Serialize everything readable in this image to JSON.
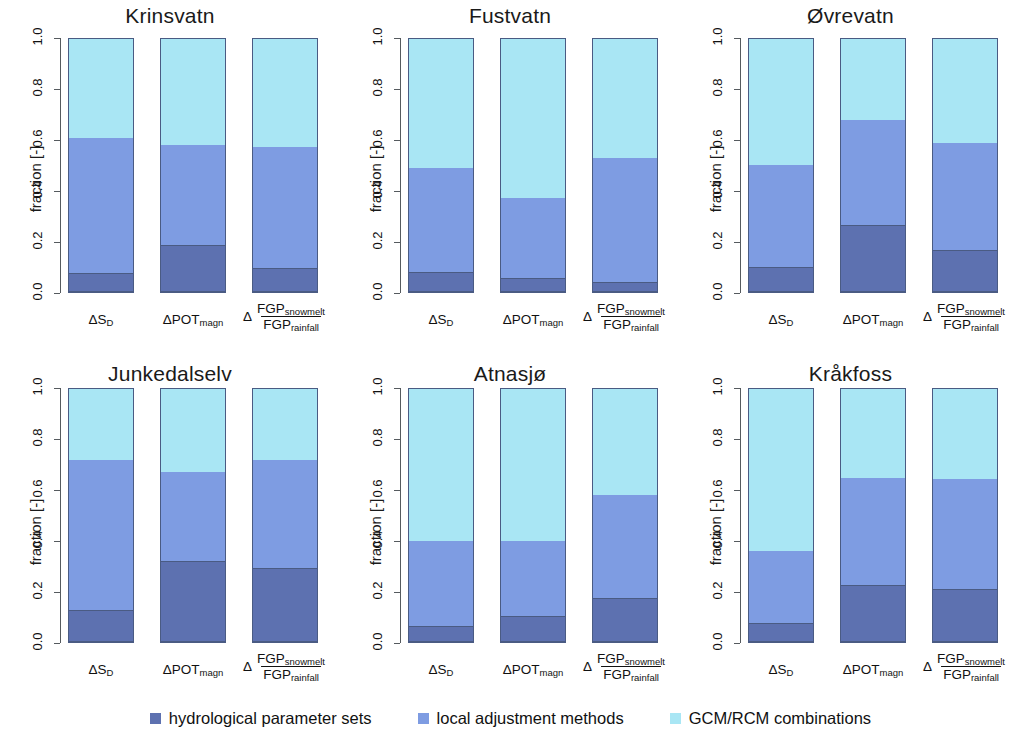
{
  "figure": {
    "ylabel": "fraction [-]",
    "y_ticks": [
      "0.0",
      "0.2",
      "0.4",
      "0.6",
      "0.8",
      "1.0"
    ],
    "x_categories": [
      "dS_D",
      "dPOT_magn",
      "d FGP_snowmelt / FGP_rainfall"
    ],
    "x_labels": [
      {
        "delta": "Δ",
        "base": "S",
        "sub": "D"
      },
      {
        "delta": "Δ",
        "base": "POT",
        "sub": "magn"
      },
      {
        "delta": "Δ",
        "num_base": "FGP",
        "num_sub": "snowmelt",
        "den_base": "FGP",
        "den_sub": "rainfall"
      }
    ]
  },
  "colors": {
    "hydrological_parameter_sets": "#5d71b0",
    "local_adjustment_methods": "#7e9ce2",
    "gcm_rcm_combinations": "#a9e6f4",
    "bar_border": "#4a5b83",
    "axis": "#555a5e"
  },
  "legend": {
    "items": [
      {
        "label": "hydrological parameter sets",
        "color_key": "hydrological_parameter_sets"
      },
      {
        "label": "local adjustment methods",
        "color_key": "local_adjustment_methods"
      },
      {
        "label": "GCM/RCM combinations",
        "color_key": "gcm_rcm_combinations"
      }
    ]
  },
  "chart_data": {
    "type": "bar",
    "title": "",
    "xlabel": "",
    "ylabel": "fraction [-]",
    "ylim": [
      0,
      1
    ],
    "grid": false,
    "legend_position": "bottom",
    "stacked": true,
    "categories": [
      "ΔS_D",
      "ΔPOT_magn",
      "Δ FGP_snowmelt/FGP_rainfall"
    ],
    "series_names": [
      "hydrological parameter sets",
      "local adjustment methods",
      "GCM/RCM combinations"
    ],
    "panels": [
      {
        "title": "Krinsvatn",
        "series": [
          {
            "name": "hydrological parameter sets",
            "values": [
              0.07,
              0.18,
              0.09
            ]
          },
          {
            "name": "local adjustment methods",
            "values": [
              0.535,
              0.395,
              0.48
            ]
          },
          {
            "name": "GCM/RCM combinations",
            "values": [
              0.395,
              0.425,
              0.43
            ]
          }
        ],
        "cumulative_tops": [
          [
            0.07,
            0.605,
            1.0
          ],
          [
            0.18,
            0.575,
            1.0
          ],
          [
            0.09,
            0.57,
            1.0
          ]
        ]
      },
      {
        "title": "Fustvatn",
        "series": [
          {
            "name": "hydrological parameter sets",
            "values": [
              0.075,
              0.05,
              0.035
            ]
          },
          {
            "name": "local adjustment methods",
            "values": [
              0.41,
              0.32,
              0.49
            ]
          },
          {
            "name": "GCM/RCM combinations",
            "values": [
              0.515,
              0.63,
              0.475
            ]
          }
        ],
        "cumulative_tops": [
          [
            0.075,
            0.485,
            1.0
          ],
          [
            0.05,
            0.37,
            1.0
          ],
          [
            0.035,
            0.525,
            1.0
          ]
        ]
      },
      {
        "title": "Øvrevatn",
        "series": [
          {
            "name": "hydrological parameter sets",
            "values": [
              0.095,
              0.26,
              0.16
            ]
          },
          {
            "name": "local adjustment methods",
            "values": [
              0.405,
              0.415,
              0.425
            ]
          },
          {
            "name": "GCM/RCM combinations",
            "values": [
              0.5,
              0.325,
              0.415
            ]
          }
        ],
        "cumulative_tops": [
          [
            0.095,
            0.5,
            1.0
          ],
          [
            0.26,
            0.675,
            1.0
          ],
          [
            0.16,
            0.585,
            1.0
          ]
        ]
      },
      {
        "title": "Junkedalselv",
        "series": [
          {
            "name": "hydrological parameter sets",
            "values": [
              0.12,
              0.315,
              0.285
            ]
          },
          {
            "name": "local adjustment methods",
            "values": [
              0.595,
              0.35,
              0.43
            ]
          },
          {
            "name": "GCM/RCM combinations",
            "values": [
              0.285,
              0.335,
              0.285
            ]
          }
        ],
        "cumulative_tops": [
          [
            0.12,
            0.715,
            1.0
          ],
          [
            0.315,
            0.665,
            1.0
          ],
          [
            0.285,
            0.715,
            1.0
          ]
        ]
      },
      {
        "title": "Atnasjø",
        "series": [
          {
            "name": "hydrological parameter sets",
            "values": [
              0.06,
              0.1,
              0.17
            ]
          },
          {
            "name": "local adjustment methods",
            "values": [
              0.335,
              0.295,
              0.405
            ]
          },
          {
            "name": "GCM/RCM combinations",
            "values": [
              0.605,
              0.605,
              0.425
            ]
          }
        ],
        "cumulative_tops": [
          [
            0.06,
            0.395,
            1.0
          ],
          [
            0.1,
            0.395,
            1.0
          ],
          [
            0.17,
            0.575,
            1.0
          ]
        ]
      },
      {
        "title": "Kråkfoss",
        "series": [
          {
            "name": "hydrological parameter sets",
            "values": [
              0.07,
              0.22,
              0.205
            ]
          },
          {
            "name": "local adjustment methods",
            "values": [
              0.285,
              0.425,
              0.435
            ]
          },
          {
            "name": "GCM/RCM combinations",
            "values": [
              0.645,
              0.355,
              0.36
            ]
          }
        ],
        "cumulative_tops": [
          [
            0.07,
            0.355,
            1.0
          ],
          [
            0.22,
            0.645,
            1.0
          ],
          [
            0.205,
            0.64,
            1.0
          ]
        ]
      }
    ]
  }
}
